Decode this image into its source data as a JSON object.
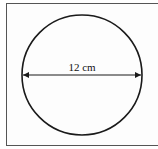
{
  "diagram": {
    "shape": "circle",
    "measurement": "diameter",
    "label": "12 cm",
    "colors": {
      "stroke": "#1a1a1a",
      "border": "#555555"
    }
  }
}
